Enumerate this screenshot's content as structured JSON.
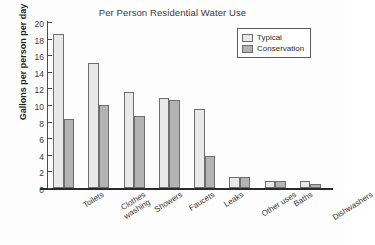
{
  "chart_data": {
    "type": "bar",
    "title": "Per Person Residential Water Use",
    "xlabel": "",
    "ylabel": "Gallons per person per day",
    "ylim": [
      0,
      20
    ],
    "yticks": [
      0,
      2,
      4,
      6,
      8,
      10,
      12,
      14,
      16,
      18,
      20
    ],
    "grid": false,
    "legend_position": "top-right",
    "categories": [
      "Toilets",
      "Clothes washing",
      "Showers",
      "Faucets",
      "Leaks",
      "Other uses",
      "Baths",
      "Dishwashers"
    ],
    "category_lines": [
      [
        "Toilets"
      ],
      [
        "Clothes",
        "washing"
      ],
      [
        "Showers"
      ],
      [
        "Faucets"
      ],
      [
        "Leaks"
      ],
      [
        "Other uses"
      ],
      [
        "Baths"
      ],
      [
        "Dishwashers"
      ]
    ],
    "series": [
      {
        "name": "Typical",
        "color": "#e9e9e9",
        "values": [
          18.6,
          15.1,
          11.6,
          10.8,
          9.5,
          1.3,
          0.8,
          0.8
        ]
      },
      {
        "name": "Conservation",
        "color": "#b3b3b3",
        "values": [
          8.3,
          10.0,
          8.7,
          10.6,
          3.8,
          1.3,
          0.8,
          0.5
        ]
      }
    ]
  },
  "legend": {
    "items": [
      {
        "label": "Typical",
        "swatch": "typical"
      },
      {
        "label": "Conservation",
        "swatch": "conservation"
      }
    ]
  }
}
